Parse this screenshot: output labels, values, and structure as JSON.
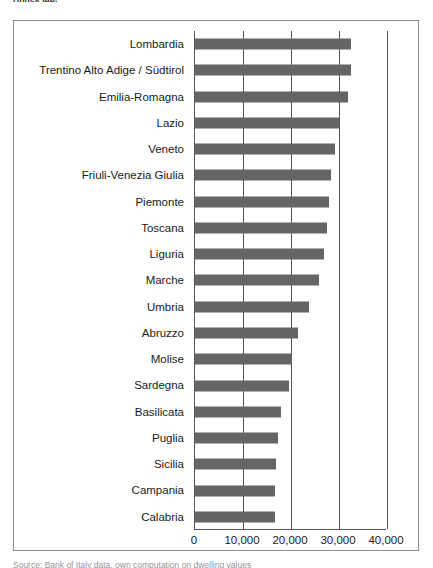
{
  "top_caption": "Annex tab.",
  "bottom_caption": "Source: Bank of Italy data, own computation on dwelling values",
  "chart_data": {
    "type": "bar",
    "orientation": "horizontal",
    "title": "",
    "xlabel": "",
    "ylabel": "",
    "xlim": [
      0,
      40000
    ],
    "grid": true,
    "legend": "none",
    "bar_color": "#656565",
    "axis_color": "#555555",
    "xticks": [
      0,
      10000,
      20000,
      30000,
      40000
    ],
    "xtick_labels": [
      "0",
      "10,000",
      "20,000",
      "30,000",
      "40,000"
    ],
    "categories": [
      "Lombardia",
      "Trentino Alto Adige / Südtirol",
      "Emilia-Romagna",
      "Lazio",
      "Veneto",
      "Friuli-Venezia Giulia",
      "Piemonte",
      "Toscana",
      "Liguria",
      "Marche",
      "Umbria",
      "Abruzzo",
      "Molise",
      "Sardegna",
      "Basilicata",
      "Puglia",
      "Sicilia",
      "Campania",
      "Calabria"
    ],
    "values": [
      32600,
      32400,
      31900,
      30000,
      29200,
      28400,
      27900,
      27500,
      26800,
      25800,
      23700,
      21400,
      20200,
      19500,
      17900,
      17300,
      16900,
      16700,
      16600
    ]
  }
}
